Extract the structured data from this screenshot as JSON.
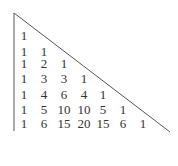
{
  "diagram": {
    "rows": [
      [
        1
      ],
      [
        1,
        1
      ],
      [
        1,
        2,
        1
      ],
      [
        1,
        3,
        3,
        1
      ],
      [
        1,
        4,
        6,
        4,
        1
      ],
      [
        1,
        5,
        10,
        10,
        5,
        1
      ],
      [
        1,
        6,
        15,
        20,
        15,
        6,
        1
      ]
    ],
    "colors": {
      "text": "#333333",
      "lines": "#555555",
      "background": "#ffffff"
    }
  }
}
